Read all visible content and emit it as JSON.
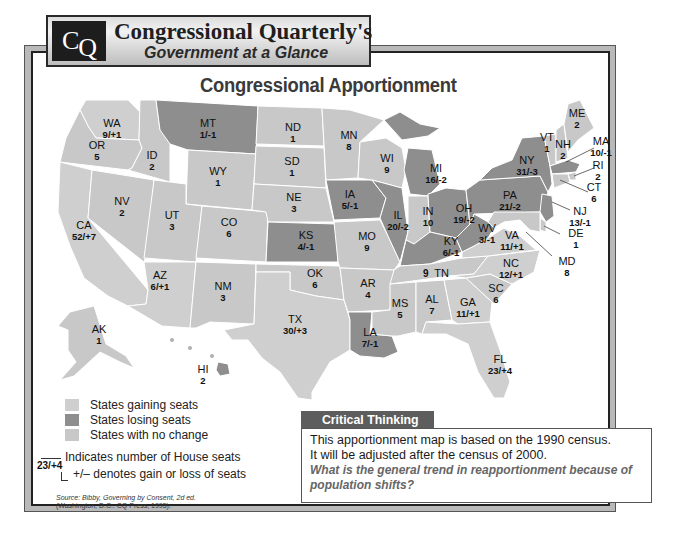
{
  "header": {
    "logo": "CQ",
    "logo_c": "C",
    "logo_q": "Q",
    "title": "Congressional Quarterly's",
    "subtitle": "Government at a Glance"
  },
  "map": {
    "title": "Congressional Apportionment",
    "colors": {
      "gaining": "#cfcfcf",
      "losing": "#8e8e8e",
      "no_change": "#c8c8c8",
      "border": "#ffffff"
    },
    "states": [
      {
        "abbr": "WA",
        "value": "9/+1",
        "status": "gaining"
      },
      {
        "abbr": "OR",
        "value": "5",
        "status": "no_change"
      },
      {
        "abbr": "CA",
        "value": "52/+7",
        "status": "gaining"
      },
      {
        "abbr": "ID",
        "value": "2",
        "status": "no_change"
      },
      {
        "abbr": "NV",
        "value": "2",
        "status": "no_change"
      },
      {
        "abbr": "MT",
        "value": "1/-1",
        "status": "losing"
      },
      {
        "abbr": "WY",
        "value": "1",
        "status": "no_change"
      },
      {
        "abbr": "UT",
        "value": "3",
        "status": "no_change"
      },
      {
        "abbr": "AZ",
        "value": "6/+1",
        "status": "gaining"
      },
      {
        "abbr": "CO",
        "value": "6",
        "status": "no_change"
      },
      {
        "abbr": "NM",
        "value": "3",
        "status": "no_change"
      },
      {
        "abbr": "ND",
        "value": "1",
        "status": "no_change"
      },
      {
        "abbr": "SD",
        "value": "1",
        "status": "no_change"
      },
      {
        "abbr": "NE",
        "value": "3",
        "status": "no_change"
      },
      {
        "abbr": "KS",
        "value": "4/-1",
        "status": "losing"
      },
      {
        "abbr": "OK",
        "value": "6",
        "status": "no_change"
      },
      {
        "abbr": "TX",
        "value": "30/+3",
        "status": "gaining"
      },
      {
        "abbr": "MN",
        "value": "8",
        "status": "no_change"
      },
      {
        "abbr": "IA",
        "value": "5/-1",
        "status": "losing"
      },
      {
        "abbr": "MO",
        "value": "9",
        "status": "no_change"
      },
      {
        "abbr": "AR",
        "value": "4",
        "status": "no_change"
      },
      {
        "abbr": "LA",
        "value": "7/-1",
        "status": "losing"
      },
      {
        "abbr": "WI",
        "value": "9",
        "status": "no_change"
      },
      {
        "abbr": "IL",
        "value": "20/-2",
        "status": "losing"
      },
      {
        "abbr": "MI",
        "value": "16/-2",
        "status": "losing"
      },
      {
        "abbr": "IN",
        "value": "10",
        "status": "no_change"
      },
      {
        "abbr": "OH",
        "value": "19/-2",
        "status": "losing"
      },
      {
        "abbr": "KY",
        "value": "6/-1",
        "status": "losing"
      },
      {
        "abbr": "TN",
        "value": "9",
        "status": "no_change"
      },
      {
        "abbr": "MS",
        "value": "5",
        "status": "no_change"
      },
      {
        "abbr": "AL",
        "value": "7",
        "status": "no_change"
      },
      {
        "abbr": "GA",
        "value": "11/+1",
        "status": "gaining"
      },
      {
        "abbr": "FL",
        "value": "23/+4",
        "status": "gaining"
      },
      {
        "abbr": "SC",
        "value": "6",
        "status": "no_change"
      },
      {
        "abbr": "NC",
        "value": "12/+1",
        "status": "gaining"
      },
      {
        "abbr": "VA",
        "value": "11/+1",
        "status": "gaining"
      },
      {
        "abbr": "WV",
        "value": "3/-1",
        "status": "losing"
      },
      {
        "abbr": "PA",
        "value": "21/-2",
        "status": "losing"
      },
      {
        "abbr": "NY",
        "value": "31/-3",
        "status": "losing"
      },
      {
        "abbr": "VT",
        "value": "1",
        "status": "no_change"
      },
      {
        "abbr": "NH",
        "value": "2",
        "status": "no_change"
      },
      {
        "abbr": "ME",
        "value": "2",
        "status": "no_change"
      },
      {
        "abbr": "MA",
        "value": "10/-1",
        "status": "losing"
      },
      {
        "abbr": "RI",
        "value": "2",
        "status": "no_change"
      },
      {
        "abbr": "CT",
        "value": "6",
        "status": "no_change"
      },
      {
        "abbr": "NJ",
        "value": "13/-1",
        "status": "losing"
      },
      {
        "abbr": "DE",
        "value": "1",
        "status": "no_change"
      },
      {
        "abbr": "MD",
        "value": "8",
        "status": "no_change"
      },
      {
        "abbr": "AK",
        "value": "1",
        "status": "no_change"
      },
      {
        "abbr": "HI",
        "value": "2",
        "status": "no_change"
      }
    ]
  },
  "legend": {
    "items": [
      {
        "label": "States gaining seats",
        "color": "#cfcfcf"
      },
      {
        "label": "States losing seats",
        "color": "#8e8e8e"
      },
      {
        "label": "States with no change",
        "color": "#c8c8c8"
      }
    ],
    "key_example": "23/+4",
    "key_seats_label": "Indicates number of House seats",
    "key_change_label": "+/– denotes gain or loss of seats"
  },
  "source": {
    "line1": "Source: Bibby, Governing by Consent, 2d ed.",
    "line2": "(Washington, D.C.: CQ Press, 1995)."
  },
  "critical_thinking": {
    "heading": "Critical Thinking",
    "body_line1": "This apportionment map is based on the 1990 census.",
    "body_line2": "It will be adjusted after the census of 2000.",
    "question": "What is the general trend in reapportionment because of population shifts?"
  }
}
